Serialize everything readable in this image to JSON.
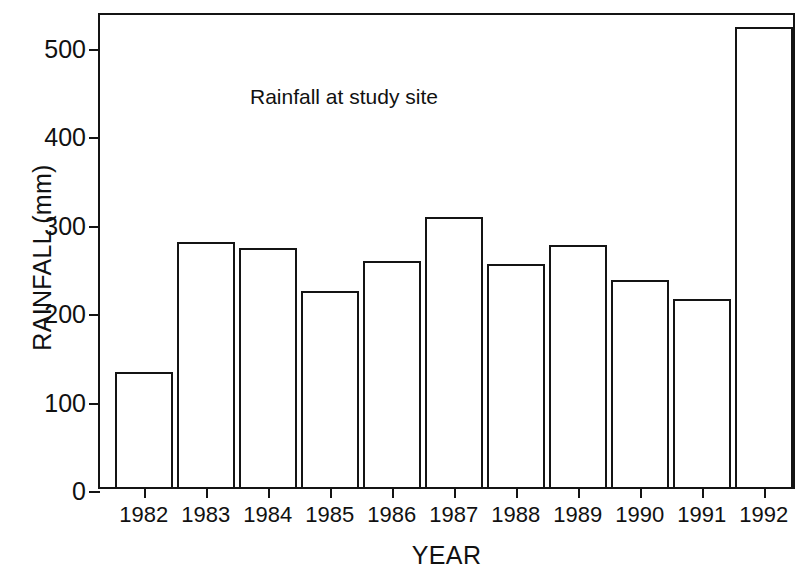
{
  "chart_data": {
    "type": "bar",
    "title": "Rainfall at study site",
    "title_position": "inside-top-left",
    "xlabel": "YEAR",
    "ylabel": "RAINFALL (mm)",
    "categories": [
      "1982",
      "1983",
      "1984",
      "1985",
      "1986",
      "1987",
      "1988",
      "1989",
      "1990",
      "1991",
      "1992"
    ],
    "values": [
      130,
      277,
      270,
      222,
      255,
      305,
      252,
      273,
      234,
      212,
      520
    ],
    "ylim": [
      0,
      538
    ],
    "yticks": [
      0,
      100,
      200,
      300,
      400,
      500
    ],
    "ytick_labels": [
      "0",
      "100",
      "200",
      "300",
      "400",
      "500"
    ],
    "grid": false,
    "legend": false,
    "bar_style": {
      "fill": "#ffffff",
      "edge": "#141414",
      "edge_width_px": 2.5
    }
  }
}
